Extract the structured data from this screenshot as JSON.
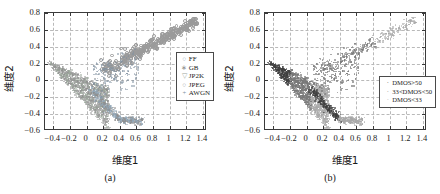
{
  "figure": {
    "axis_x_label": "维度1",
    "axis_y_label": "维度2",
    "caption_a": "(a)",
    "caption_b": "(b)"
  },
  "chart_data": [
    {
      "type": "scatter",
      "panel": "(a)",
      "title": "",
      "xlabel": "维度1",
      "ylabel": "维度2",
      "xlim": [
        -0.5,
        1.45
      ],
      "ylim": [
        -0.6,
        0.8
      ],
      "xticks": [
        -0.4,
        -0.2,
        0,
        0.2,
        0.4,
        0.6,
        0.8,
        1,
        1.2,
        1.4
      ],
      "xticklabels": [
        "-0.4",
        "-0.2",
        "0",
        "0.2",
        "0.4",
        "0.6",
        "0.8",
        "1",
        "1.2",
        "1.4"
      ],
      "yticks": [
        -0.6,
        -0.4,
        -0.2,
        0,
        0.2,
        0.4,
        0.6,
        0.8
      ],
      "yticklabels": [
        "-0.6",
        "-0.4",
        "-0.2",
        "0",
        "0.2",
        "0.4",
        "0.6",
        "0.8"
      ],
      "grid": true,
      "legend_position": "center-right",
      "series": [
        {
          "name": "FF",
          "marker": "circle-open",
          "color": "#8fa6b8"
        },
        {
          "name": "GB",
          "marker": "asterisk",
          "color": "#8c8c8c"
        },
        {
          "name": "JP2K",
          "marker": "triangle-down",
          "color": "#9aa79a"
        },
        {
          "name": "JPEG",
          "marker": "circle-open",
          "color": "#9b9b9b"
        },
        {
          "name": "AWGN",
          "marker": "plus",
          "color": "#7f8f9f"
        }
      ]
    },
    {
      "type": "scatter",
      "panel": "(b)",
      "title": "",
      "xlabel": "维度1",
      "ylabel": "维度2",
      "xlim": [
        -0.5,
        1.45
      ],
      "ylim": [
        -0.6,
        0.8
      ],
      "xticks": [
        -0.4,
        -0.2,
        0,
        0.2,
        0.4,
        0.6,
        0.8,
        1,
        1.2,
        1.4
      ],
      "xticklabels": [
        "-0.4",
        "-0.2",
        "0",
        "0.2",
        "0.4",
        "0.6",
        "0.8",
        "1",
        "1.2",
        "1.4"
      ],
      "yticks": [
        -0.6,
        -0.4,
        -0.2,
        0,
        0.2,
        0.4,
        0.6,
        0.8
      ],
      "yticklabels": [
        "-0.6",
        "-0.4",
        "-0.2",
        "0",
        "0.2",
        "0.4",
        "0.6",
        "0.8"
      ],
      "grid": true,
      "legend_position": "lower-right",
      "series": [
        {
          "name": "DMOS>50",
          "marker": "dot",
          "color": "#3f3f3f"
        },
        {
          "name": "33<DMOS<50",
          "marker": "dot",
          "color": "#777777"
        },
        {
          "name": "DMOS<33",
          "marker": "dot",
          "color": "#a8a8a8"
        }
      ]
    }
  ]
}
